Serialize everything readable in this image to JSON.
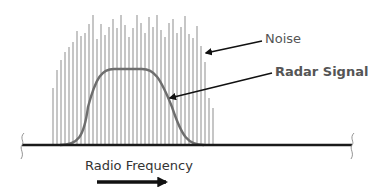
{
  "diagram": {
    "labels": {
      "noise": "Noise",
      "radar_signal": "Radar Signal",
      "axis": "Radio Frequency"
    },
    "colors": {
      "noise_lines": "#a8a8a8",
      "signal_curve": "#6e6e6e",
      "baseline": "#1a1a1a",
      "arrows": "#111111",
      "text": "#555555"
    },
    "baseline": {
      "y": 145,
      "x_start": 22,
      "x_end": 352
    },
    "noise": {
      "x_start": 53,
      "spacing": 4,
      "tops": [
        88,
        70,
        60,
        52,
        47,
        42,
        31,
        36,
        33,
        24,
        15,
        39,
        24,
        35,
        27,
        19,
        28,
        15,
        25,
        37,
        28,
        15,
        23,
        33,
        17,
        27,
        15,
        30,
        37,
        23,
        19,
        33,
        27,
        16,
        34,
        38,
        26,
        46,
        62,
        98,
        108
      ]
    },
    "signal": {
      "baseline_y": 145,
      "peak_y": 69,
      "rise_start_x": 68,
      "rise_end_x": 108,
      "fall_start_x": 148,
      "fall_end_x": 196
    },
    "annotations": [
      {
        "name": "noise-arrow",
        "from": [
          262,
          41
        ],
        "to": [
          206,
          53
        ]
      },
      {
        "name": "radar-arrow",
        "from": [
          272,
          73
        ],
        "to": [
          170,
          98
        ]
      },
      {
        "name": "frequency-arrow",
        "from": [
          97,
          182
        ],
        "to": [
          166,
          182
        ]
      }
    ]
  }
}
